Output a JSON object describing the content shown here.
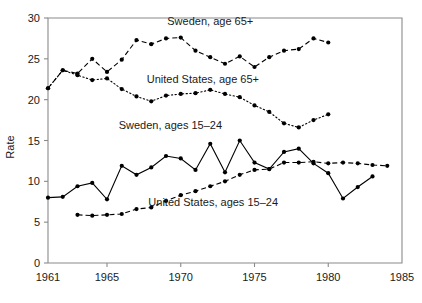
{
  "chart_data": {
    "type": "line",
    "title": "",
    "xlabel": "",
    "ylabel": "Rate",
    "xlim": [
      1961,
      1985
    ],
    "ylim": [
      0,
      30
    ],
    "xticks": [
      1961,
      1965,
      1970,
      1975,
      1980,
      1985
    ],
    "xticklabels": [
      "1961",
      "1965",
      "1970",
      "1975",
      "1980",
      "1985"
    ],
    "yticks": [
      0,
      5,
      10,
      15,
      20,
      25,
      30
    ],
    "yticklabels": [
      "0",
      "5",
      "10",
      "15",
      "20",
      "25",
      "30"
    ],
    "grid": false,
    "legend_position": "inline-annotations",
    "x": [
      1961,
      1962,
      1963,
      1964,
      1965,
      1966,
      1967,
      1968,
      1969,
      1970,
      1971,
      1972,
      1973,
      1974,
      1975,
      1976,
      1977,
      1978,
      1979,
      1980,
      1981,
      1982,
      1983,
      1984
    ],
    "series": [
      {
        "name": "Sweden, age 65+",
        "label": "Sweden, age 65+",
        "style": "dashed",
        "marker": "filled-circle",
        "label_x": 1972.0,
        "label_y": 29.2,
        "values": [
          21.4,
          23.6,
          23.2,
          25.0,
          23.4,
          24.9,
          27.3,
          26.8,
          27.5,
          27.6,
          26.0,
          25.2,
          24.4,
          25.3,
          24.0,
          25.2,
          26.0,
          26.2,
          27.5,
          27.0,
          null,
          null,
          null,
          null
        ]
      },
      {
        "name": "United States, age 65+",
        "label": "United States, age 65+",
        "style": "dotted",
        "marker": "filled-circle",
        "label_x": 1971.5,
        "label_y": 22.1,
        "values": [
          21.4,
          23.6,
          23.0,
          22.4,
          22.6,
          21.3,
          20.4,
          19.8,
          20.5,
          20.7,
          20.8,
          21.2,
          20.7,
          20.3,
          19.3,
          18.5,
          17.1,
          16.6,
          17.5,
          18.2,
          null,
          null,
          null,
          null
        ]
      },
      {
        "name": "Sweden, ages 15-24",
        "label": "Sweden, ages 15–24",
        "style": "solid",
        "marker": "filled-circle",
        "label_x": 1969.3,
        "label_y": 16.4,
        "values": [
          8.0,
          8.1,
          9.4,
          9.8,
          7.8,
          11.9,
          10.8,
          11.7,
          13.1,
          12.8,
          11.4,
          14.6,
          11.1,
          15.0,
          12.3,
          11.5,
          13.6,
          14.0,
          12.2,
          11.0,
          7.9,
          9.3,
          10.6,
          null
        ]
      },
      {
        "name": "United States, ages 15-24",
        "label": "United States, ages 15–24",
        "style": "dashed",
        "marker": "filled-circle",
        "label_x": 1972.2,
        "label_y": 7.0,
        "values": [
          null,
          null,
          5.9,
          5.8,
          5.9,
          6.0,
          6.6,
          6.8,
          7.6,
          8.3,
          8.8,
          9.4,
          10.0,
          10.8,
          11.4,
          11.5,
          12.3,
          12.3,
          12.4,
          12.2,
          12.3,
          12.2,
          12.0,
          11.9
        ]
      }
    ]
  }
}
